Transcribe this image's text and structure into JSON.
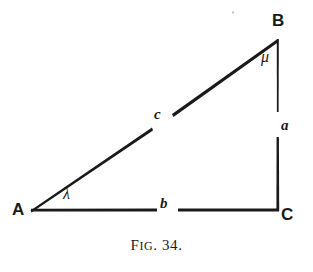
{
  "figure": {
    "caption_prefix": "F",
    "caption_small_caps": "IG",
    "caption_suffix": ". 34.",
    "caption_full": "FIG. 34.",
    "background_color": "#ffffff",
    "ink_color": "#1a1a1a"
  },
  "diagram": {
    "type": "right-triangle",
    "vertices": [
      {
        "id": "A",
        "label": "A",
        "x": 30,
        "y": 210
      },
      {
        "id": "B",
        "label": "B",
        "x": 278,
        "y": 38
      },
      {
        "id": "C",
        "label": "C",
        "x": 277,
        "y": 210
      }
    ],
    "sides": [
      {
        "id": "AB",
        "label": "c",
        "from": "A",
        "to": "B",
        "role": "hypotenuse"
      },
      {
        "id": "BC",
        "label": "a",
        "from": "B",
        "to": "C",
        "role": "opposite-vertical"
      },
      {
        "id": "AC",
        "label": "b",
        "from": "A",
        "to": "C",
        "role": "adjacent-base"
      }
    ],
    "angles": [
      {
        "at": "A",
        "label": "λ",
        "name": "lambda"
      },
      {
        "at": "B",
        "label": "μ",
        "name": "mu"
      },
      {
        "at": "C",
        "label": "",
        "name": "right-angle"
      }
    ]
  }
}
